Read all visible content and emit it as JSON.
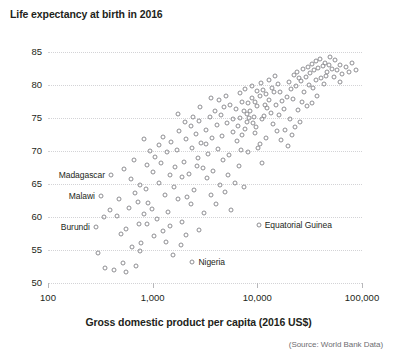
{
  "chart_data": {
    "type": "scatter",
    "title": "Life expectancy at birth in 2016",
    "ylabel": "Life expectancy at birth in 2016",
    "xlabel": "Gross domestic product per capita (2016 US$)",
    "source": "(Source: World Bank Data)",
    "xscale": "log",
    "xlim": [
      100,
      100000
    ],
    "ylim": [
      50,
      85
    ],
    "grid": true,
    "legend": "none",
    "xticks": [
      {
        "value": 100,
        "label": "100"
      },
      {
        "value": 1000,
        "label": "1,000"
      },
      {
        "value": 10000,
        "label": "10,000"
      },
      {
        "value": 100000,
        "label": "100,000"
      }
    ],
    "yticks": [
      {
        "value": 85,
        "label": "85"
      },
      {
        "value": 80,
        "label": "80"
      },
      {
        "value": 75,
        "label": "75"
      },
      {
        "value": 70,
        "label": "70"
      },
      {
        "value": 65,
        "label": "65"
      },
      {
        "value": 60,
        "label": "60"
      },
      {
        "value": 55,
        "label": "55"
      },
      {
        "value": 50,
        "label": "50"
      }
    ],
    "annotations": [
      {
        "label": "Madagascar",
        "x": 400,
        "y": 66.3,
        "side": "left"
      },
      {
        "label": "Malawi",
        "x": 320,
        "y": 63.2,
        "side": "left"
      },
      {
        "label": "Burundi",
        "x": 286,
        "y": 58.5,
        "side": "left"
      },
      {
        "label": "Equatorial Guinea",
        "x": 10300,
        "y": 58.8,
        "side": "right"
      },
      {
        "label": "Nigeria",
        "x": 2400,
        "y": 53.2,
        "side": "right"
      }
    ],
    "points": [
      {
        "x": 400,
        "y": 66.3
      },
      {
        "x": 320,
        "y": 63.2
      },
      {
        "x": 286,
        "y": 58.5
      },
      {
        "x": 10300,
        "y": 58.8
      },
      {
        "x": 2400,
        "y": 53.2
      },
      {
        "x": 300,
        "y": 54.5
      },
      {
        "x": 350,
        "y": 52.3
      },
      {
        "x": 430,
        "y": 51.9
      },
      {
        "x": 520,
        "y": 53.1
      },
      {
        "x": 700,
        "y": 52.6
      },
      {
        "x": 640,
        "y": 55.4
      },
      {
        "x": 780,
        "y": 56.1
      },
      {
        "x": 500,
        "y": 57.4
      },
      {
        "x": 460,
        "y": 60.2
      },
      {
        "x": 600,
        "y": 61.4
      },
      {
        "x": 560,
        "y": 58.2
      },
      {
        "x": 740,
        "y": 58.9
      },
      {
        "x": 820,
        "y": 60.5
      },
      {
        "x": 900,
        "y": 62.1
      },
      {
        "x": 680,
        "y": 63.6
      },
      {
        "x": 760,
        "y": 64.9
      },
      {
        "x": 870,
        "y": 64.2
      },
      {
        "x": 980,
        "y": 61.2
      },
      {
        "x": 1100,
        "y": 59.7
      },
      {
        "x": 1250,
        "y": 57.9
      },
      {
        "x": 1400,
        "y": 60.8
      },
      {
        "x": 1300,
        "y": 63.4
      },
      {
        "x": 1150,
        "y": 65.2
      },
      {
        "x": 1000,
        "y": 66.8
      },
      {
        "x": 880,
        "y": 67.9
      },
      {
        "x": 1050,
        "y": 69.1
      },
      {
        "x": 1200,
        "y": 68.2
      },
      {
        "x": 1450,
        "y": 66.3
      },
      {
        "x": 1600,
        "y": 64.5
      },
      {
        "x": 1750,
        "y": 62.8
      },
      {
        "x": 1900,
        "y": 59.2
      },
      {
        "x": 2100,
        "y": 57.3
      },
      {
        "x": 1850,
        "y": 55.7
      },
      {
        "x": 1550,
        "y": 54.2
      },
      {
        "x": 1350,
        "y": 56.2
      },
      {
        "x": 2300,
        "y": 61.9
      },
      {
        "x": 2500,
        "y": 64.1
      },
      {
        "x": 2200,
        "y": 66.5
      },
      {
        "x": 2000,
        "y": 68.4
      },
      {
        "x": 1700,
        "y": 70.2
      },
      {
        "x": 1500,
        "y": 71.4
      },
      {
        "x": 1250,
        "y": 72.1
      },
      {
        "x": 1800,
        "y": 73.0
      },
      {
        "x": 2100,
        "y": 71.8
      },
      {
        "x": 2400,
        "y": 70.5
      },
      {
        "x": 2700,
        "y": 69.0
      },
      {
        "x": 3000,
        "y": 67.4
      },
      {
        "x": 3300,
        "y": 65.9
      },
      {
        "x": 3600,
        "y": 63.3
      },
      {
        "x": 3100,
        "y": 60.6
      },
      {
        "x": 2800,
        "y": 58.1
      },
      {
        "x": 4000,
        "y": 62.0
      },
      {
        "x": 4400,
        "y": 64.8
      },
      {
        "x": 3800,
        "y": 66.9
      },
      {
        "x": 3400,
        "y": 69.6
      },
      {
        "x": 2900,
        "y": 71.2
      },
      {
        "x": 2600,
        "y": 72.6
      },
      {
        "x": 2300,
        "y": 73.8
      },
      {
        "x": 2750,
        "y": 74.6
      },
      {
        "x": 3200,
        "y": 73.2
      },
      {
        "x": 3700,
        "y": 71.9
      },
      {
        "x": 4200,
        "y": 70.3
      },
      {
        "x": 4700,
        "y": 68.7
      },
      {
        "x": 5200,
        "y": 66.4
      },
      {
        "x": 4900,
        "y": 63.8
      },
      {
        "x": 5600,
        "y": 61.0
      },
      {
        "x": 6100,
        "y": 65.1
      },
      {
        "x": 5400,
        "y": 69.4
      },
      {
        "x": 4600,
        "y": 72.3
      },
      {
        "x": 4100,
        "y": 74.0
      },
      {
        "x": 3500,
        "y": 75.1
      },
      {
        "x": 3900,
        "y": 76.0
      },
      {
        "x": 4500,
        "y": 75.4
      },
      {
        "x": 5100,
        "y": 74.2
      },
      {
        "x": 5800,
        "y": 72.9
      },
      {
        "x": 6400,
        "y": 71.5
      },
      {
        "x": 7000,
        "y": 70.1
      },
      {
        "x": 6700,
        "y": 67.8
      },
      {
        "x": 7400,
        "y": 64.6
      },
      {
        "x": 8200,
        "y": 69.8
      },
      {
        "x": 7700,
        "y": 73.4
      },
      {
        "x": 6900,
        "y": 75.0
      },
      {
        "x": 6200,
        "y": 76.3
      },
      {
        "x": 5500,
        "y": 77.0
      },
      {
        "x": 4800,
        "y": 76.6
      },
      {
        "x": 5900,
        "y": 74.8
      },
      {
        "x": 6600,
        "y": 73.8
      },
      {
        "x": 7200,
        "y": 72.5
      },
      {
        "x": 8000,
        "y": 74.4
      },
      {
        "x": 8600,
        "y": 76.1
      },
      {
        "x": 9200,
        "y": 75.2
      },
      {
        "x": 9800,
        "y": 73.6
      },
      {
        "x": 10500,
        "y": 71.0
      },
      {
        "x": 11200,
        "y": 74.9
      },
      {
        "x": 10000,
        "y": 76.8
      },
      {
        "x": 9400,
        "y": 77.5
      },
      {
        "x": 8800,
        "y": 78.0
      },
      {
        "x": 8100,
        "y": 77.2
      },
      {
        "x": 7500,
        "y": 76.0
      },
      {
        "x": 7900,
        "y": 75.6
      },
      {
        "x": 8400,
        "y": 75.0
      },
      {
        "x": 9000,
        "y": 74.3
      },
      {
        "x": 9600,
        "y": 72.8
      },
      {
        "x": 10200,
        "y": 70.4
      },
      {
        "x": 11000,
        "y": 68.2
      },
      {
        "x": 12000,
        "y": 72.0
      },
      {
        "x": 11500,
        "y": 75.3
      },
      {
        "x": 12500,
        "y": 76.5
      },
      {
        "x": 13000,
        "y": 77.8
      },
      {
        "x": 12200,
        "y": 78.6
      },
      {
        "x": 11300,
        "y": 79.2
      },
      {
        "x": 10600,
        "y": 78.3
      },
      {
        "x": 13500,
        "y": 75.8
      },
      {
        "x": 14200,
        "y": 74.1
      },
      {
        "x": 15000,
        "y": 77.0
      },
      {
        "x": 14500,
        "y": 78.9
      },
      {
        "x": 15800,
        "y": 80.1
      },
      {
        "x": 16500,
        "y": 79.0
      },
      {
        "x": 17200,
        "y": 77.6
      },
      {
        "x": 16000,
        "y": 75.5
      },
      {
        "x": 18000,
        "y": 76.4
      },
      {
        "x": 19000,
        "y": 78.2
      },
      {
        "x": 20000,
        "y": 80.4
      },
      {
        "x": 21000,
        "y": 79.4
      },
      {
        "x": 22000,
        "y": 77.9
      },
      {
        "x": 23500,
        "y": 79.8
      },
      {
        "x": 25000,
        "y": 81.0
      },
      {
        "x": 24000,
        "y": 82.0
      },
      {
        "x": 22500,
        "y": 81.5
      },
      {
        "x": 26000,
        "y": 80.6
      },
      {
        "x": 27500,
        "y": 82.4
      },
      {
        "x": 29000,
        "y": 81.2
      },
      {
        "x": 30500,
        "y": 82.8
      },
      {
        "x": 32000,
        "y": 81.8
      },
      {
        "x": 33500,
        "y": 83.2
      },
      {
        "x": 35000,
        "y": 82.2
      },
      {
        "x": 36500,
        "y": 83.6
      },
      {
        "x": 38000,
        "y": 82.6
      },
      {
        "x": 40000,
        "y": 83.9
      },
      {
        "x": 42000,
        "y": 82.9
      },
      {
        "x": 44000,
        "y": 83.4
      },
      {
        "x": 46000,
        "y": 82.0
      },
      {
        "x": 48000,
        "y": 83.0
      },
      {
        "x": 50000,
        "y": 84.2
      },
      {
        "x": 52000,
        "y": 82.5
      },
      {
        "x": 55000,
        "y": 83.8
      },
      {
        "x": 58000,
        "y": 82.2
      },
      {
        "x": 61000,
        "y": 83.1
      },
      {
        "x": 65000,
        "y": 81.6
      },
      {
        "x": 70000,
        "y": 82.8
      },
      {
        "x": 75000,
        "y": 82.0
      },
      {
        "x": 80000,
        "y": 83.4
      },
      {
        "x": 88000,
        "y": 82.3
      },
      {
        "x": 28000,
        "y": 79.0
      },
      {
        "x": 31000,
        "y": 80.0
      },
      {
        "x": 34000,
        "y": 79.5
      },
      {
        "x": 37000,
        "y": 78.3
      },
      {
        "x": 26500,
        "y": 77.4
      },
      {
        "x": 24500,
        "y": 76.2
      },
      {
        "x": 20500,
        "y": 74.8
      },
      {
        "x": 18500,
        "y": 73.2
      },
      {
        "x": 17000,
        "y": 71.6
      },
      {
        "x": 19500,
        "y": 70.8
      },
      {
        "x": 21500,
        "y": 72.4
      },
      {
        "x": 23000,
        "y": 73.6
      },
      {
        "x": 25500,
        "y": 74.4
      },
      {
        "x": 41000,
        "y": 81.0
      },
      {
        "x": 43000,
        "y": 80.2
      },
      {
        "x": 45000,
        "y": 81.4
      },
      {
        "x": 29500,
        "y": 76.8
      },
      {
        "x": 33000,
        "y": 77.2
      },
      {
        "x": 5000,
        "y": 78.4
      },
      {
        "x": 4300,
        "y": 77.8
      },
      {
        "x": 6800,
        "y": 78.8
      },
      {
        "x": 7600,
        "y": 79.4
      },
      {
        "x": 8900,
        "y": 79.8
      },
      {
        "x": 10800,
        "y": 80.3
      },
      {
        "x": 12800,
        "y": 80.8
      },
      {
        "x": 14800,
        "y": 81.3
      },
      {
        "x": 3600,
        "y": 78.0
      },
      {
        "x": 2850,
        "y": 76.6
      },
      {
        "x": 2450,
        "y": 75.2
      },
      {
        "x": 2050,
        "y": 74.4
      },
      {
        "x": 1650,
        "y": 67.6
      },
      {
        "x": 1380,
        "y": 69.8
      },
      {
        "x": 1150,
        "y": 70.9
      },
      {
        "x": 950,
        "y": 70.0
      },
      {
        "x": 820,
        "y": 71.8
      },
      {
        "x": 1480,
        "y": 58.6
      },
      {
        "x": 1020,
        "y": 57.1
      },
      {
        "x": 760,
        "y": 54.9
      },
      {
        "x": 560,
        "y": 51.6
      },
      {
        "x": 480,
        "y": 62.8
      },
      {
        "x": 390,
        "y": 61.0
      },
      {
        "x": 340,
        "y": 60.0
      },
      {
        "x": 620,
        "y": 65.8
      },
      {
        "x": 530,
        "y": 67.2
      },
      {
        "x": 720,
        "y": 62.2
      },
      {
        "x": 890,
        "y": 59.0
      },
      {
        "x": 660,
        "y": 68.6
      },
      {
        "x": 1750,
        "y": 75.6
      },
      {
        "x": 2650,
        "y": 67.8
      },
      {
        "x": 3250,
        "y": 71.0
      },
      {
        "x": 15500,
        "y": 73.0
      },
      {
        "x": 54000,
        "y": 81.2
      },
      {
        "x": 62000,
        "y": 80.4
      },
      {
        "x": 36000,
        "y": 80.8
      },
      {
        "x": 2150,
        "y": 63.0
      },
      {
        "x": 1900,
        "y": 66.0
      },
      {
        "x": 13800,
        "y": 79.6
      },
      {
        "x": 11800,
        "y": 77.0
      },
      {
        "x": 9900,
        "y": 79.1
      },
      {
        "x": 7100,
        "y": 77.4
      }
    ]
  }
}
